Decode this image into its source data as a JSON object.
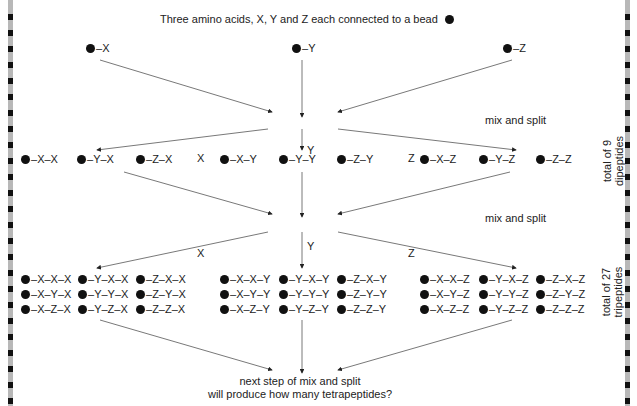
{
  "title": "Three amino acids, X, Y and Z each connected to a bead",
  "start": [
    "X",
    "Y",
    "Z"
  ],
  "step_label": "mix and split",
  "branch_labels": [
    "X",
    "Y",
    "Z"
  ],
  "dipeptides": [
    [
      "X-X",
      "Y-X",
      "Z-X"
    ],
    [
      "X-Y",
      "Y-Y",
      "Z-Y"
    ],
    [
      "X-Z",
      "Y-Z",
      "Z-Z"
    ]
  ],
  "dipeptide_total": [
    "total of 9",
    "dipeptides"
  ],
  "tripeptides": [
    [
      [
        "X-X-X",
        "X-Y-X",
        "X-Z-X"
      ],
      [
        "Y-X-X",
        "Y-Y-X",
        "Y-Z-X"
      ],
      [
        "Z-X-X",
        "Z-Y-X",
        "Z-Z-X"
      ]
    ],
    [
      [
        "X-X-Y",
        "X-Y-Y",
        "X-Z-Y"
      ],
      [
        "Y-X-Y",
        "Y-Y-Y",
        "Y-Z-Y"
      ],
      [
        "Z-X-Y",
        "Z-Y-Y",
        "Z-Z-Y"
      ]
    ],
    [
      [
        "X-X-Z",
        "X-Y-Z",
        "X-Z-Z"
      ],
      [
        "Y-X-Z",
        "Y-Y-Z",
        "Y-Z-Z"
      ],
      [
        "Z-X-Z",
        "Z-Y-Z",
        "Z-Z-Z"
      ]
    ]
  ],
  "tripeptide_total": [
    "total of 27",
    "tripeptides"
  ],
  "question": [
    "next step of mix and split",
    "will produce how many tetrapeptides?"
  ]
}
